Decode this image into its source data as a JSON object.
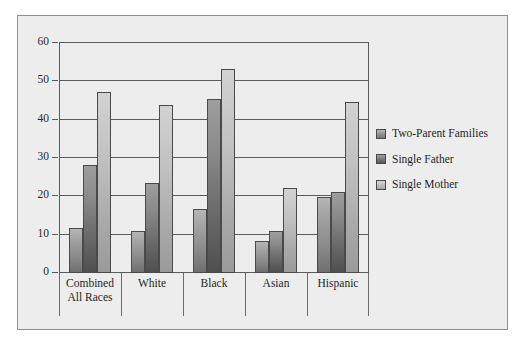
{
  "chart_data": {
    "type": "bar",
    "title": "",
    "subtitle": "",
    "xlabel": "",
    "ylabel": "",
    "ylim": [
      0,
      60
    ],
    "yticks": [
      0,
      10,
      20,
      30,
      40,
      50,
      60
    ],
    "ytick_labels": [
      "0",
      "10",
      "20",
      "30",
      "40",
      "50",
      "60"
    ],
    "grid": true,
    "legend_position": "right",
    "categories": [
      "Combined\nAll Races",
      "White",
      "Black",
      "Asian",
      "Hispanic"
    ],
    "category_lines": [
      [
        "Combined",
        "All Races"
      ],
      [
        "White"
      ],
      [
        "Black"
      ],
      [
        "Asian"
      ],
      [
        "Hispanic"
      ]
    ],
    "series": [
      {
        "name": "Two-Parent  Families",
        "color": "#9c9c9c",
        "values": [
          11.8,
          11.0,
          16.8,
          8.4,
          19.7
        ]
      },
      {
        "name": "Single Father",
        "color": "#6d6d6d",
        "values": [
          28.2,
          23.6,
          45.5,
          11.0,
          21.2
        ]
      },
      {
        "name": "Single Mother",
        "color": "#c2c2c2",
        "values": [
          47.2,
          43.9,
          53.3,
          22.3,
          44.5
        ]
      }
    ]
  },
  "colors": {
    "panel_background": "#ededed",
    "panel_border": "#8e8e8e",
    "grid": "#5a5a5a",
    "axis": "#3f3f3f",
    "text": "#1f1f1f"
  }
}
